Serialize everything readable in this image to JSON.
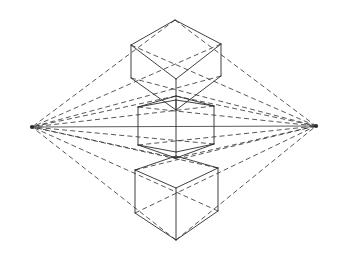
{
  "figure": {
    "type": "line-drawing",
    "canvas": {
      "width": 343,
      "height": 271,
      "background": "#ffffff"
    },
    "ink_color": "#2b2b2b",
    "construction_color": "#3a3a3a",
    "horizon_color": "#4a4a4a"
  },
  "chart_data": {
    "type": "diagram",
    "vanishing_points": [
      {
        "name": "left-vanishing-point",
        "x": 32,
        "y": 127
      },
      {
        "name": "right-vanishing-point",
        "x": 316,
        "y": 126
      }
    ],
    "horizon_line": {
      "x1": 32,
      "y1": 127,
      "x2": 316,
      "y2": 126
    },
    "cubes": [
      {
        "name": "upper-cube",
        "position": "above-horizon",
        "vertices": {
          "top_back": [
            175,
            20
          ],
          "top_left": [
            131,
            45
          ],
          "top_right": [
            221,
            44
          ],
          "top_front": [
            176,
            79
          ],
          "bottom_left": [
            131,
            78
          ],
          "bottom_right": [
            221,
            76
          ],
          "bottom_front": [
            176,
            110
          ]
        }
      },
      {
        "name": "middle-cube",
        "position": "on-horizon",
        "vertices": {
          "top_back": [
            176,
            96
          ],
          "top_left": [
            138,
            107
          ],
          "top_right": [
            214,
            106
          ],
          "top_front": [
            176,
            100
          ],
          "bottom_left": [
            138,
            145
          ],
          "bottom_right": [
            214,
            144
          ],
          "bottom_front": [
            176,
            158
          ]
        }
      },
      {
        "name": "lower-cube",
        "position": "below-horizon",
        "vertices": {
          "top_back": [
            176,
            156
          ],
          "top_left": [
            135,
            170
          ],
          "top_right": [
            218,
            168
          ],
          "top_front": [
            176,
            188
          ],
          "bottom_left": [
            135,
            213
          ],
          "bottom_right": [
            218,
            211
          ],
          "bottom_front": [
            176,
            240
          ]
        }
      }
    ],
    "line_styles": {
      "cube_edges": "solid",
      "projection_rays": "dashed",
      "horizon": "solid"
    }
  }
}
